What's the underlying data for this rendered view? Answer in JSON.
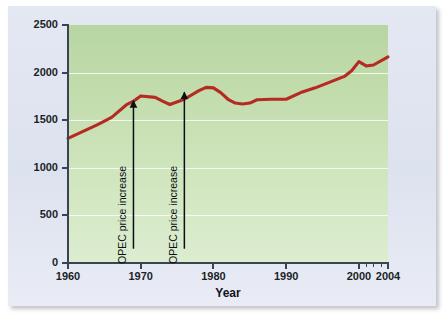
{
  "chart_data": {
    "type": "line",
    "title": "",
    "xlabel": "Year",
    "ylabel": "Million metric tons of oil equivalent",
    "xlim": [
      1960,
      2004
    ],
    "ylim": [
      0,
      2500
    ],
    "grid": true,
    "legend": false,
    "series_color": "#b52a22",
    "x": [
      1960,
      1962,
      1964,
      1966,
      1968,
      1969,
      1970,
      1972,
      1973,
      1974,
      1976,
      1978,
      1979,
      1980,
      1981,
      1982,
      1983,
      1984,
      1985,
      1986,
      1988,
      1990,
      1992,
      1994,
      1996,
      1998,
      1999,
      2000,
      2001,
      2002,
      2004
    ],
    "values": [
      1310,
      1380,
      1450,
      1530,
      1660,
      1700,
      1755,
      1740,
      1700,
      1665,
      1720,
      1810,
      1845,
      1840,
      1790,
      1720,
      1680,
      1670,
      1680,
      1715,
      1720,
      1720,
      1790,
      1840,
      1900,
      1960,
      2020,
      2115,
      2070,
      2080,
      2165
    ],
    "x_ticks": [
      1960,
      1970,
      1980,
      1990,
      2000,
      2004
    ],
    "x_minor_ticks": [
      2001,
      2002,
      2003
    ],
    "y_ticks": [
      0,
      500,
      1000,
      1500,
      2000,
      2500
    ],
    "annotations": [
      {
        "label": "OPEC price increase",
        "x": 1969,
        "y": 1755
      },
      {
        "label": "OPEC price increase",
        "x": 1976,
        "y": 1845
      }
    ],
    "plot_background": "#c5dfb0",
    "panel_background": "#dfe4f0"
  }
}
